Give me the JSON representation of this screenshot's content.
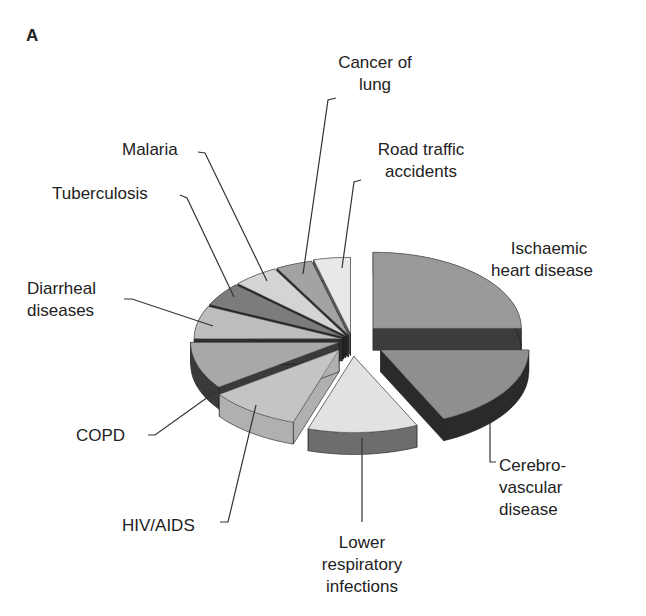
{
  "panel_letter": "A",
  "chart_data": {
    "type": "pie",
    "style": "3d-exploded",
    "title": "",
    "note": "No numeric data labels shown; shares estimated from slice angles (percent of total).",
    "categories": [
      "Ischaemic heart disease",
      "Cerebrovascular disease",
      "Lower respiratory infections",
      "HIV/AIDS",
      "COPD",
      "Diarrheal diseases",
      "Tuberculosis",
      "Malaria",
      "Cancer of lung",
      "Road traffic accidents"
    ],
    "values": [
      25,
      18,
      12,
      10,
      10,
      7,
      5,
      5,
      4,
      4
    ],
    "colors": [
      "#9a9a9a",
      "#8f8f8f",
      "#e2e2e2",
      "#c4c4c4",
      "#a8a8a8",
      "#bdbdbd",
      "#7c7c7c",
      "#d4d4d4",
      "#a3a3a3",
      "#e8e8e8"
    ],
    "side_colors": [
      "#3c3c3c",
      "#2a2a2a",
      "#6d6d6d",
      "#b0b0b0",
      "#3a3a3a",
      "#2e2e2e",
      "#242424",
      "#262626",
      "#2c2c2c",
      "#5a5a5a"
    ],
    "legend": "none (callout labels)",
    "labels": [
      {
        "text": "Ischaemic\nheart disease"
      },
      {
        "text": "Cerebro-\nvascular\ndisease"
      },
      {
        "text": "Lower\nrespiratory\ninfections"
      },
      {
        "text": "HIV/AIDS"
      },
      {
        "text": "COPD"
      },
      {
        "text": "Diarrheal\ndiseases"
      },
      {
        "text": "Tuberculosis"
      },
      {
        "text": "Malaria"
      },
      {
        "text": "Cancer of\nlung"
      },
      {
        "text": "Road traffic\naccidents"
      }
    ]
  },
  "labels": {
    "ihd_1": "Ischaemic",
    "ihd_2": "heart disease",
    "cvd_1": "Cerebro-",
    "cvd_2": "vascular",
    "cvd_3": "disease",
    "lri_1": "Lower",
    "lri_2": "respiratory",
    "lri_3": "infections",
    "hiv": "HIV/AIDS",
    "copd": "COPD",
    "diar_1": "Diarrheal",
    "diar_2": "diseases",
    "tb": "Tuberculosis",
    "malaria": "Malaria",
    "lung_1": "Cancer of",
    "lung_2": "lung",
    "road_1": "Road traffic",
    "road_2": "accidents"
  }
}
